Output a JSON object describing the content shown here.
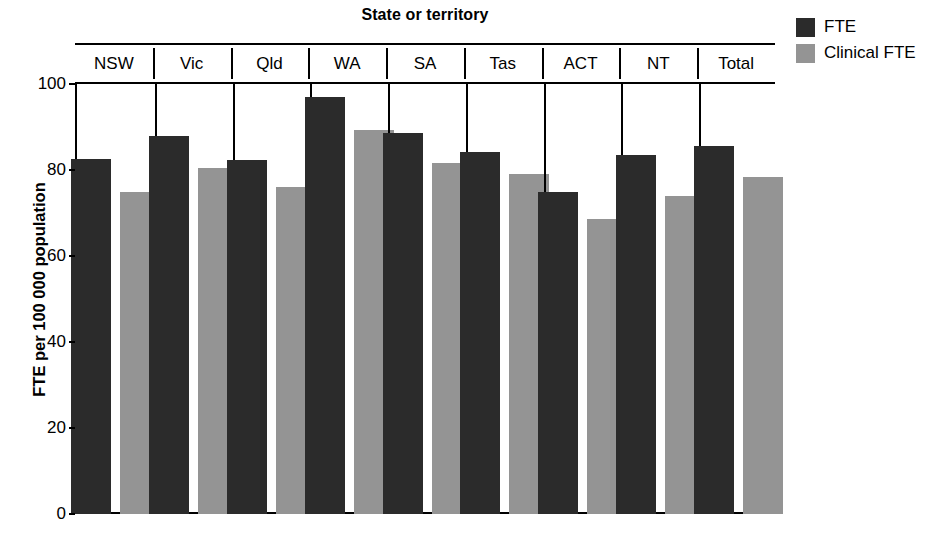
{
  "chart_data": {
    "type": "bar",
    "title": "State or territory",
    "xlabel": "State or territory",
    "ylabel": "FTE per 100 000 population",
    "ylim": [
      0,
      100
    ],
    "yticks": [
      0,
      20,
      40,
      60,
      80,
      100
    ],
    "grid": false,
    "legend_position": "top-right",
    "categories": [
      "NSW",
      "Vic",
      "Qld",
      "WA",
      "SA",
      "Tas",
      "ACT",
      "NT",
      "Total"
    ],
    "series": [
      {
        "name": "FTE",
        "color": "#2b2b2b",
        "values": [
          82.5,
          87.9,
          82.3,
          97.0,
          88.6,
          84.2,
          75.0,
          83.4,
          85.6
        ]
      },
      {
        "name": "Clinical FTE",
        "color": "#949494",
        "values": [
          74.9,
          80.5,
          76.0,
          89.3,
          81.6,
          79.1,
          68.6,
          74.0,
          78.3
        ]
      }
    ]
  },
  "legend": {
    "items": [
      {
        "label": "FTE",
        "color": "#2b2b2b"
      },
      {
        "label": "Clinical FTE",
        "color": "#949494"
      }
    ]
  },
  "axis": {
    "y_title": "FTE per 100 000 population",
    "tick_labels": [
      "100",
      "80",
      "60",
      "40",
      "20",
      "0"
    ]
  },
  "header": {
    "title": "State or territory"
  }
}
